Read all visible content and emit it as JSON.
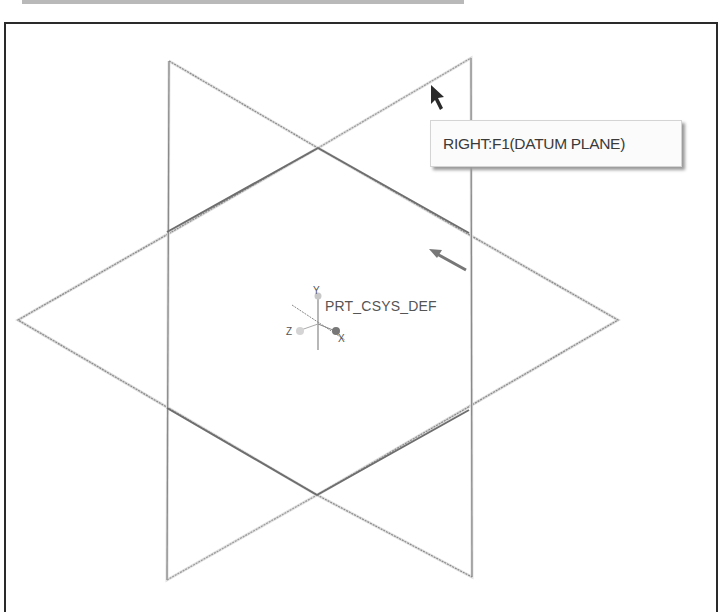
{
  "toolbar": {
    "visible": "partial"
  },
  "viewport": {
    "tooltip": {
      "text": "RIGHT:F1(DATUM PLANE)"
    },
    "csys": {
      "label": "PRT_CSYS_DEF",
      "axes": {
        "x": "X",
        "y": "Y",
        "z": "Z"
      }
    },
    "colors": {
      "frame": "#2a2a2a",
      "plane_edge": "#8a8a8a",
      "plane_highlight": "#6e6e6e",
      "background": "#ffffff",
      "tooltip_bg": "#fbfbfb"
    }
  }
}
